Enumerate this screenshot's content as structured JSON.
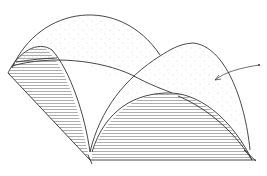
{
  "figure": {
    "background": "#ffffff",
    "stroke_color": "#333333",
    "stipple_color": "#888888",
    "hatch_color": "#666666",
    "annotation": {
      "type": "leader-arrow",
      "label": ""
    }
  }
}
